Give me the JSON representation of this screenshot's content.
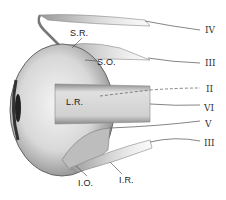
{
  "diagram": {
    "muscle_labels": [
      {
        "id": "sr",
        "text": "S.R.",
        "x": 70,
        "y": 28
      },
      {
        "id": "so",
        "text": "S.O.",
        "x": 97,
        "y": 57
      },
      {
        "id": "lr",
        "text": "L.R.",
        "x": 66,
        "y": 97
      },
      {
        "id": "io",
        "text": "I.O.",
        "x": 78,
        "y": 178
      },
      {
        "id": "ir",
        "text": "I.R.",
        "x": 119,
        "y": 175
      }
    ],
    "nerve_labels": [
      {
        "id": "n4",
        "text": "IV",
        "x": 205,
        "y": 25
      },
      {
        "id": "n3a",
        "text": "III",
        "x": 205,
        "y": 58
      },
      {
        "id": "n2",
        "text": "II",
        "x": 206,
        "y": 84
      },
      {
        "id": "n6",
        "text": "VI",
        "x": 204,
        "y": 103
      },
      {
        "id": "n5",
        "text": "V",
        "x": 205,
        "y": 119
      },
      {
        "id": "n3b",
        "text": "III",
        "x": 204,
        "y": 138
      }
    ],
    "colors": {
      "background": "#ffffff",
      "ink": "#333333",
      "shade_dark": "#6b6b6b",
      "shade_mid": "#a8a8a8",
      "shade_light": "#dcdcdc"
    }
  }
}
